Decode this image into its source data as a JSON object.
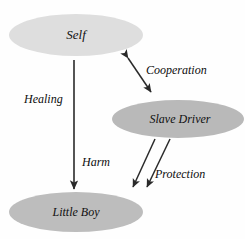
{
  "diagram": {
    "type": "node-link-diagram",
    "background_color": "#fefefe",
    "nodes": [
      {
        "id": "self",
        "label": "Self",
        "shape": "ellipse",
        "fill": "#dedede",
        "cx": 76,
        "cy": 35,
        "rx": 67,
        "ry": 21,
        "font_size": 13
      },
      {
        "id": "slave-driver",
        "label": "Slave Driver",
        "shape": "ellipse",
        "fill": "#b9b9b9",
        "cx": 178,
        "cy": 119,
        "rx": 66,
        "ry": 19,
        "font_size": 12
      },
      {
        "id": "little-boy",
        "label": "Little Boy",
        "shape": "ellipse",
        "fill": "#bdbdbd",
        "cx": 76,
        "cy": 212,
        "rx": 67,
        "ry": 20,
        "font_size": 12
      }
    ],
    "edges": [
      {
        "id": "healing",
        "label": "Healing",
        "from": "self",
        "to": "little-boy",
        "direction": "one-way",
        "x1": 74,
        "y1": 60,
        "x2": 74,
        "y2": 192,
        "label_x": 24,
        "label_y": 100,
        "font_size": 12,
        "stroke_width": 1.6
      },
      {
        "id": "cooperation",
        "label": "Cooperation",
        "from": "self",
        "to": "slave-driver",
        "direction": "two-way",
        "x1": 126,
        "y1": 55,
        "x2": 153,
        "y2": 95,
        "label_x": 146,
        "label_y": 71,
        "font_size": 12,
        "stroke_width": 1.5
      },
      {
        "id": "harm",
        "label": "Harm",
        "from": "slave-driver",
        "to": "little-boy",
        "direction": "one-way",
        "x1": 155,
        "y1": 139,
        "x2": 131,
        "y2": 190,
        "label_x": 96,
        "label_y": 163,
        "font_size": 12,
        "stroke_width": 1.5
      },
      {
        "id": "protection",
        "label": "Protection",
        "from": "slave-driver",
        "to": "little-boy",
        "direction": "one-way",
        "x1": 170,
        "y1": 139,
        "x2": 145,
        "y2": 190,
        "label_x": 155,
        "label_y": 175,
        "font_size": 12,
        "stroke_width": 1.5
      }
    ]
  }
}
